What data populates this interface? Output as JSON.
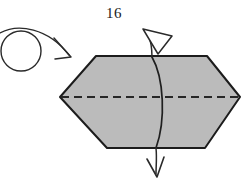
{
  "figure": {
    "step_number": "16",
    "width": 246,
    "height": 184,
    "background_color": "#ffffff"
  },
  "colors": {
    "paper_fill": "#bbbbbb",
    "outline": "#1c1c1c",
    "fold_line": "#262626",
    "arrow_stroke": "#2a2a2a",
    "arrow_fill": "#ffffff",
    "text": "#1a1a1a"
  },
  "shape": {
    "name": "hexagon-paper",
    "description": "elongated gray hexagon representing folded paper",
    "points": "60,97 96,56 207,56 240,97 205,148 107,148",
    "vertices": [
      {
        "label": "left-point",
        "x": 60,
        "y": 97
      },
      {
        "label": "top-left",
        "x": 96,
        "y": 56
      },
      {
        "label": "top-right",
        "x": 207,
        "y": 56
      },
      {
        "label": "right-point",
        "x": 240,
        "y": 97
      },
      {
        "label": "bottom-right",
        "x": 205,
        "y": 148
      },
      {
        "label": "bottom-left",
        "x": 107,
        "y": 148
      }
    ]
  },
  "fold_line": {
    "name": "horizontal-dashed-fold-line",
    "type": "valley-fold-dashed",
    "x1": 61,
    "y1": 97,
    "x2": 239,
    "y2": 97,
    "dash_pattern": "8 5",
    "stroke_width": 1.8
  },
  "rotate_symbol": {
    "name": "turn-over-rotate-symbol",
    "description": "circle with curved arrow indicating turn the model over",
    "circle": {
      "cx": 21,
      "cy": 51,
      "r": 20
    },
    "arrow_path": "M 1 33 C 18 23 48 27 68 53",
    "arrow_tip": {
      "x": 71,
      "y": 57
    }
  },
  "unfold_arrow": {
    "name": "unfold-pull-arrow",
    "description": "curved line through paper with hollow arrowhead at top and solid thin arrowhead at bottom",
    "curve_path": "M 152 57 C 164 78 166 120 156 148",
    "top_stem_path": "M 152 57 C 152 47 150 40 147 33",
    "bottom_stem_path": "M 156 148 C 156 158 155 166 155 173",
    "hollow_arrowhead_points": "144,30 171,35 159,53",
    "bottom_arrowhead_path": "M 148 160 L 156 177 L 163 158"
  },
  "labels": {
    "step_label": "16"
  }
}
